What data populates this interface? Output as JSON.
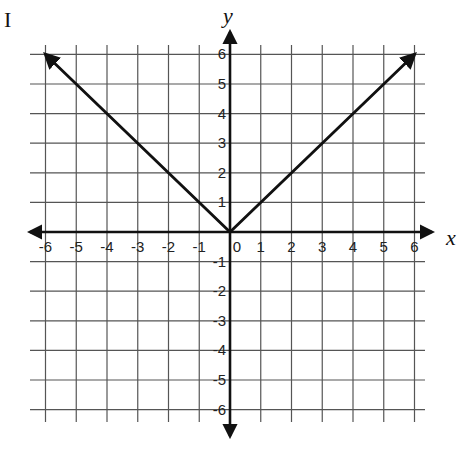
{
  "figure_marker": "I",
  "chart_data": {
    "type": "line",
    "title": "",
    "xlabel": "x",
    "ylabel": "y",
    "xlim": [
      -6,
      6
    ],
    "ylim": [
      -6,
      6
    ],
    "grid": true,
    "x_ticks": [
      -6,
      -5,
      -4,
      -3,
      -2,
      -1,
      0,
      1,
      2,
      3,
      4,
      5,
      6
    ],
    "y_ticks": [
      6,
      5,
      4,
      3,
      2,
      1,
      -1,
      -2,
      -3,
      -4,
      -5,
      -6
    ],
    "series": [
      {
        "name": "y = |x|",
        "x": [
          -6,
          0,
          6
        ],
        "y": [
          6,
          0,
          6
        ],
        "arrows_at_ends": true,
        "color": "#111111"
      }
    ]
  },
  "layout": {
    "origin_px": [
      230,
      232
    ],
    "unit_x_px": 30.75,
    "unit_y_px": 29.6,
    "grid_extent_px": {
      "left": 30,
      "right": 425,
      "top": 45,
      "bottom": 422
    },
    "colors": {
      "grid": "#555555",
      "axis": "#111111",
      "line": "#111111"
    }
  }
}
